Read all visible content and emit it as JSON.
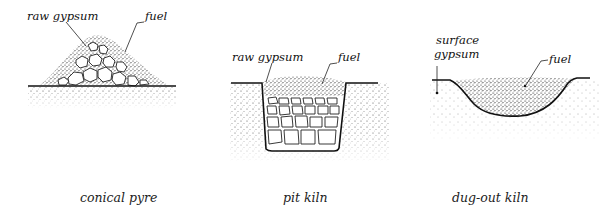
{
  "diagrams": [
    {
      "id": "conical-pyre",
      "caption": "conical pyre",
      "labels": {
        "raw_gypsum": "raw gypsum",
        "fuel": "fuel"
      }
    },
    {
      "id": "pit-kiln",
      "caption": "pit kiln",
      "labels": {
        "raw_gypsum": "raw gypsum",
        "fuel": "fuel"
      }
    },
    {
      "id": "dug-out-kiln",
      "caption": "dug-out kiln",
      "labels": {
        "surface_gypsum_line1": "surface",
        "surface_gypsum_line2": "gypsum",
        "fuel": "fuel"
      }
    }
  ],
  "colors": {
    "ink": "#111111",
    "background": "#ffffff"
  }
}
